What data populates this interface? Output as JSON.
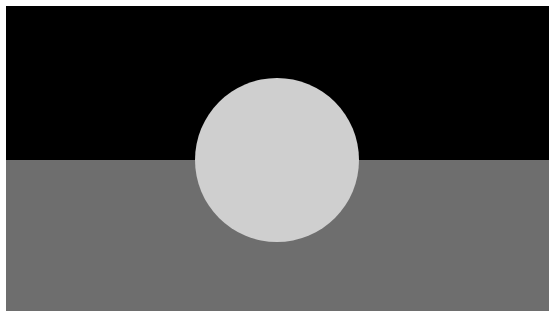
{
  "image": {
    "subject": "flag",
    "description": "Horizontal bicolor flag with central disc (grayscale)",
    "colors": {
      "border": "#ffffff",
      "top_band": "#000000",
      "bottom_band": "#6e6e6e",
      "disc": "#cfcfcf"
    },
    "disc": {
      "cx": 277,
      "cy": 160,
      "r": 82
    }
  }
}
